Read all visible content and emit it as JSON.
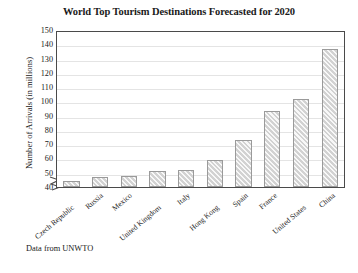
{
  "chart_data": {
    "type": "bar",
    "title": "World Top Tourism Destinations Forecasted for 2020",
    "xlabel": "",
    "ylabel": "Number of Arrivals (in millions)",
    "ylim": [
      40,
      150
    ],
    "yticks": [
      150,
      140,
      130,
      120,
      110,
      100,
      90,
      80,
      70,
      60,
      50,
      40
    ],
    "axis_break": true,
    "grid": true,
    "legend": "none",
    "categories": [
      "Czech Republic",
      "Russia",
      "Mexico",
      "United Kingdom",
      "Italy",
      "Hong Kong",
      "Spain",
      "France",
      "United States",
      "China"
    ],
    "values": [
      44,
      47,
      48,
      51,
      52,
      59,
      73,
      93,
      102,
      137
    ],
    "bar_fill_color": "#d2d2d2",
    "bar_edge_color": "#9a9a9a",
    "annotation": "Data from UNWTO"
  },
  "notes": {
    "source": "Data from UNWTO"
  }
}
